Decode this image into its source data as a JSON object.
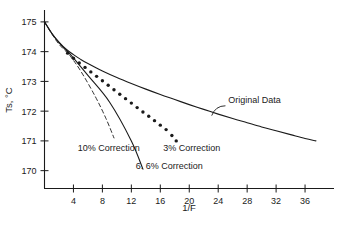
{
  "figure": {
    "name": "superheat-temperature-vs-inverse-F-chart",
    "background_color": "#ffffff",
    "ink_color": "#1a1a1a"
  },
  "chart_data": {
    "type": "line",
    "title": "",
    "subtitle": "",
    "xlabel": "1/F",
    "ylabel": "Ts, °C",
    "xlim": [
      0,
      40
    ],
    "ylim": [
      169.4,
      175.4
    ],
    "xticks": [
      4,
      8,
      12,
      16,
      20,
      24,
      28,
      32,
      36
    ],
    "xtick_labels": [
      "4",
      "8",
      "12",
      "16",
      "20",
      "24",
      "28",
      "32",
      "36"
    ],
    "yticks": [
      170,
      171,
      172,
      173,
      174,
      175
    ],
    "ytick_labels": [
      "170",
      "171",
      "172",
      "173",
      "174",
      "175"
    ],
    "grid": false,
    "legend": "none",
    "annotations": [
      {
        "name": "original-data-label",
        "text": "Original Data",
        "x": 25.4,
        "y": 172.26
      },
      {
        "name": "three-percent-correction-label",
        "text": "3% Correction",
        "x": 16.4,
        "y": 170.66
      },
      {
        "name": "ten-percent-correction-label",
        "text": "10% Correction",
        "x": 4.6,
        "y": 170.67
      },
      {
        "name": "six-point-six-percent-correction-label",
        "text": "6. 6% Correction",
        "x": 12.6,
        "y": 170.07
      }
    ],
    "series": [
      {
        "name": "Original Data",
        "style": "solid-line",
        "x": [
          0,
          1,
          2,
          3,
          4,
          5,
          6,
          8,
          10,
          12,
          14,
          16,
          18,
          20,
          22,
          24,
          26,
          28,
          30,
          32,
          34,
          36,
          37.5
        ],
        "values": [
          175.0,
          174.62,
          174.32,
          174.08,
          173.9,
          173.74,
          173.6,
          173.35,
          173.13,
          172.93,
          172.74,
          172.56,
          172.39,
          172.22,
          172.06,
          171.9,
          171.75,
          171.61,
          171.47,
          171.34,
          171.21,
          171.08,
          171.0
        ]
      },
      {
        "name": "3% Correction",
        "style": "dotted-markers",
        "x": [
          3.2,
          4.0,
          4.8,
          5.6,
          6.4,
          7.2,
          8.0,
          8.8,
          9.6,
          10.4,
          11.2,
          12.0,
          12.8,
          13.6,
          14.4,
          15.2,
          16.0,
          16.8,
          17.6,
          18.2
        ],
        "values": [
          173.95,
          173.78,
          173.62,
          173.47,
          173.32,
          173.17,
          173.02,
          172.87,
          172.72,
          172.57,
          172.42,
          172.27,
          172.12,
          171.97,
          171.83,
          171.68,
          171.53,
          171.38,
          171.18,
          171.0
        ]
      },
      {
        "name": "6. 6% Correction",
        "style": "solid-line",
        "x": [
          0,
          1,
          2,
          3,
          3.6,
          6,
          9,
          12,
          13.6
        ],
        "values": [
          175.0,
          174.62,
          174.3,
          174.04,
          173.9,
          173.2,
          172.3,
          171.0,
          170.05
        ]
      },
      {
        "name": "10% Correction",
        "style": "dashed-line",
        "x": [
          0,
          1,
          2,
          3,
          3.5,
          5,
          7,
          8.5,
          9.6
        ],
        "values": [
          175.0,
          174.6,
          174.25,
          174.0,
          173.87,
          173.35,
          172.5,
          171.75,
          171.1
        ]
      }
    ],
    "leaders": [
      {
        "name": "original-data-leader",
        "from_x": 25.0,
        "from_y": 172.18,
        "to_x": 23.1,
        "to_y": 171.85
      }
    ]
  }
}
